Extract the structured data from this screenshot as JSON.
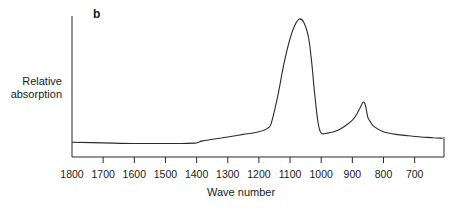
{
  "chart_data": {
    "type": "line",
    "panel_label": "b",
    "title": "",
    "xlabel": "Wave number",
    "ylabel_line1": "Relative",
    "ylabel_line2": "absorption",
    "xlim": [
      1800,
      610
    ],
    "x_reversed": true,
    "x_ticks": [
      1800,
      1700,
      1600,
      1500,
      1400,
      1300,
      1200,
      1100,
      1000,
      900,
      800,
      700
    ],
    "y_ticks": [],
    "grid": false,
    "legend": null,
    "series": [
      {
        "name": "Relative absorption",
        "x": [
          1800,
          1700,
          1600,
          1500,
          1450,
          1400,
          1380,
          1300,
          1250,
          1200,
          1170,
          1160,
          1140,
          1120,
          1100,
          1085,
          1070,
          1055,
          1040,
          1030,
          1020,
          1010,
          1000,
          980,
          960,
          940,
          920,
          900,
          885,
          870,
          865,
          860,
          855,
          850,
          840,
          830,
          800,
          760,
          720,
          680,
          640,
          610
        ],
        "y": [
          0.05,
          0.045,
          0.04,
          0.04,
          0.04,
          0.045,
          0.06,
          0.09,
          0.11,
          0.13,
          0.16,
          0.2,
          0.4,
          0.65,
          0.85,
          0.95,
          1.0,
          0.97,
          0.85,
          0.65,
          0.4,
          0.2,
          0.12,
          0.12,
          0.13,
          0.15,
          0.18,
          0.22,
          0.27,
          0.34,
          0.36,
          0.35,
          0.3,
          0.24,
          0.2,
          0.17,
          0.13,
          0.11,
          0.1,
          0.09,
          0.085,
          0.08
        ]
      }
    ],
    "peaks": [
      {
        "wavenumber": 1070,
        "relative": 1.0
      },
      {
        "wavenumber": 860,
        "relative": 0.36
      }
    ]
  }
}
